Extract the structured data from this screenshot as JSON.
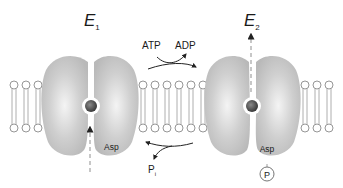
{
  "diagram": {
    "states": [
      {
        "id": "E1",
        "label": "E",
        "subscript": "1"
      },
      {
        "id": "E2",
        "label": "E",
        "subscript": "2"
      }
    ],
    "reactions": {
      "forward": {
        "substrate": "ATP",
        "product": "ADP"
      },
      "reverse": {
        "product": "P",
        "product_subscript": "i"
      }
    },
    "residue_labels": {
      "e1": "Asp",
      "e2": "Asp"
    },
    "phosphate_label": "P",
    "colors": {
      "protein": "#c8c8c8",
      "protein_highlight": "#f2f2f2",
      "ion": "#4a4a4a",
      "lipid": "#8a8a8a",
      "arrow": "#222222",
      "dashed_path": "#b5b5b5"
    }
  }
}
